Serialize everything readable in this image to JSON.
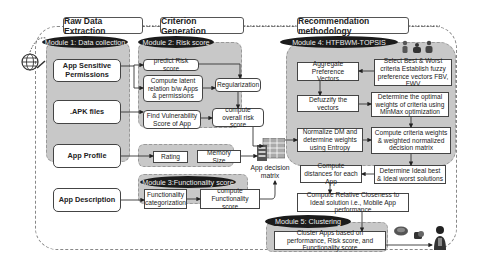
{
  "headers": {
    "raw_data": "Raw Data Extraction",
    "criterion": "Criterion Generation",
    "recommendation": "Recommendation methodology"
  },
  "modules": {
    "m1": "Module 1: Data collection",
    "m2": "Module 2: Risk score",
    "m3": "Module 3:Functionality  score",
    "m4": "Module 4:     HTFBWM-TOPSIS",
    "m5": "Module 5: Clustering"
  },
  "data_collection": {
    "permissions": "App Sensitive Permissions",
    "apk": ".APK files",
    "profile": "App Profile",
    "description": "App Description"
  },
  "risk": {
    "predict": "predict Risk score",
    "latent": "Compute latent relation b/w Apps & permissions",
    "regularization": "Regularization",
    "vulnerability": "Find  Vulnerability Score of App",
    "overall": "compute overall risk score"
  },
  "profile_attrs": {
    "rating": "Rating",
    "memory": "Memory Size"
  },
  "functionality": {
    "categorization": "Functionality categorization",
    "compute": "compute Functionality score"
  },
  "decision_matrix_label": "App decision matrix",
  "topsis": {
    "aggregate": "Aggregate Preference Vectors",
    "select": "Select Best & Worst criteria Establish fuzzy preference vectors FBV, FWV",
    "defuzzify": "Defuzzify the vectors",
    "optimal": "Determine the optimal weights of criteria using MinMax optimization",
    "normalize": "Normalize DM and determine weights using Entropy",
    "weighted": "Compute criteria weights & weighted normalized decision matrix",
    "distances": "Compute distances for each App",
    "ideal": "Determine Ideal best & Ideal worst solutions",
    "closeness": "Compute Relative Closeness to Ideal solution i.e., Mobile App performance"
  },
  "clustering": {
    "cluster": "Cluster Apps  based on performance, Risk score, and Functionality score"
  },
  "icons": [
    "globe-icon",
    "people-icon",
    "decision-matrix-icon",
    "cloud-devices-icon",
    "user-icon"
  ]
}
